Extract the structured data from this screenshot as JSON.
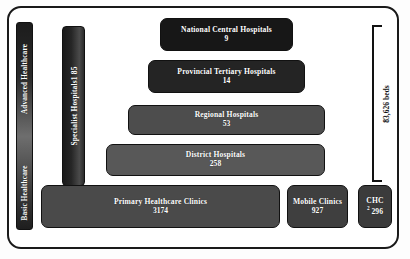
{
  "diagram": {
    "spectrum": {
      "name": "healthcare-level-spectrum",
      "top_label": "Advanced Healthcare",
      "bottom_label": "Basic Healthcare"
    },
    "specialist": {
      "label": "Specialist Hospitals",
      "superscript": "1",
      "value": "85"
    },
    "beds": {
      "label": "83,626 beds"
    },
    "levels": [
      {
        "name": "national-central-hospitals",
        "label": "National Central Hospitals",
        "value": "9",
        "color": "#171717"
      },
      {
        "name": "provincial-tertiary-hospitals",
        "label": "Provincial Tertiary Hospitals",
        "value": "14",
        "color": "#242424"
      },
      {
        "name": "regional-hospitals",
        "label": "Regional Hospitals",
        "value": "53",
        "color": "#4d4d4d"
      },
      {
        "name": "district-hospitals",
        "label": "District Hospitals",
        "value": "258",
        "color": "#585858"
      },
      {
        "name": "primary-healthcare-clinics",
        "label": "Primary Healthcare Clinics",
        "value": "3174",
        "color": "#4a4a4a"
      },
      {
        "name": "mobile-clinics",
        "label": "Mobile Clinics",
        "value": "927",
        "color": "#3f3f3f"
      },
      {
        "name": "community-health-centres",
        "label": "CHC",
        "superscript": "2",
        "value": "296",
        "color": "#3b3b3b"
      }
    ]
  }
}
